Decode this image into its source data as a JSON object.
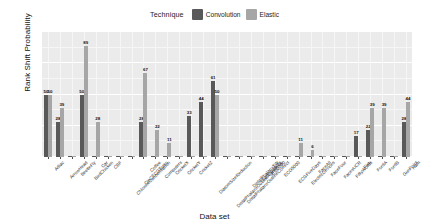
{
  "chart_data": {
    "type": "bar",
    "title": "",
    "xlabel": "Data set",
    "ylabel": "Rank Shift Probability",
    "ylim": [
      0,
      100
    ],
    "yticks": [
      0,
      25,
      50,
      75,
      100
    ],
    "grid": true,
    "legend_title": "Technique",
    "legend_position": "top",
    "colors": {
      "Convolution": "#595959",
      "Elastic": "#a6a6a6",
      "panel": "#ebebeb",
      "gridline": "#ffffff"
    },
    "categories": [
      "Adiac",
      "ArrowHead",
      "BeetleFly",
      "BirdChicken",
      "Car",
      "CBF",
      "ChlorineConcentration",
      "CinCECGTorso",
      "Coffee",
      "Computers",
      "CricketX",
      "CricketY",
      "CricketZ",
      "DiatomSizeReduction",
      "DistalPhalanxOutlineAgeGroup",
      "DistalPhalanxOutlineCorrect",
      "DistalPhalanxTW",
      "Earthquakes",
      "ECG200",
      "ECG5000",
      "ECGFiveDays",
      "ElectricDevices",
      "FaceAll",
      "FaceFour",
      "FacesUCR",
      "FiftyWords",
      "Fish",
      "FordA",
      "FordB",
      "GunPoint",
      "Ham"
    ],
    "series": [
      {
        "name": "Convolution",
        "values": [
          50,
          28,
          0,
          50,
          0,
          0,
          0,
          0,
          28,
          0,
          0,
          0,
          33,
          44,
          61,
          0,
          0,
          0,
          0,
          0,
          0,
          0,
          0,
          0,
          0,
          0,
          17,
          22,
          0,
          0,
          28
        ]
      },
      {
        "name": "Elastic",
        "values": [
          50,
          39,
          0,
          89,
          28,
          0,
          0,
          0,
          67,
          22,
          11,
          0,
          0,
          0,
          50,
          0,
          0,
          0,
          0,
          0,
          0,
          11,
          6,
          0,
          0,
          0,
          0,
          39,
          39,
          0,
          44
        ]
      }
    ],
    "value_labels_shown": true,
    "nonzero_labels": [
      {
        "category": "Adiac",
        "series": "Convolution",
        "value": 50
      },
      {
        "category": "Adiac",
        "series": "Elastic",
        "value": 50
      },
      {
        "category": "ArrowHead",
        "series": "Convolution",
        "value": 28
      },
      {
        "category": "ArrowHead",
        "series": "Elastic",
        "value": 39
      },
      {
        "category": "BirdChicken",
        "series": "Convolution",
        "value": 50
      },
      {
        "category": "BirdChicken",
        "series": "Elastic",
        "value": 89
      },
      {
        "category": "Car",
        "series": "Elastic",
        "value": 28
      },
      {
        "category": "Coffee",
        "series": "Convolution",
        "value": 28
      },
      {
        "category": "Coffee",
        "series": "Elastic",
        "value": 67
      },
      {
        "category": "Computers",
        "series": "Elastic",
        "value": 22
      },
      {
        "category": "CricketX",
        "series": "Elastic",
        "value": 11
      },
      {
        "category": "CricketZ",
        "series": "Convolution",
        "value": 33
      },
      {
        "category": "DiatomSizeReduction",
        "series": "Convolution",
        "value": 44
      },
      {
        "category": "DistalPhalanxOutlineAgeGroup",
        "series": "Convolution",
        "value": 61
      },
      {
        "category": "DistalPhalanxOutlineAgeGroup",
        "series": "Elastic",
        "value": 50
      },
      {
        "category": "ElectricDevices",
        "series": "Elastic",
        "value": 11
      },
      {
        "category": "FaceAll",
        "series": "Elastic",
        "value": 6
      },
      {
        "category": "Fish",
        "series": "Convolution",
        "value": 17
      },
      {
        "category": "FordA",
        "series": "Convolution",
        "value": 22
      },
      {
        "category": "FordA",
        "series": "Elastic",
        "value": 39
      },
      {
        "category": "FordB",
        "series": "Elastic",
        "value": 39
      },
      {
        "category": "Ham",
        "series": "Convolution",
        "value": 28
      },
      {
        "category": "Ham",
        "series": "Elastic",
        "value": 44
      }
    ]
  }
}
